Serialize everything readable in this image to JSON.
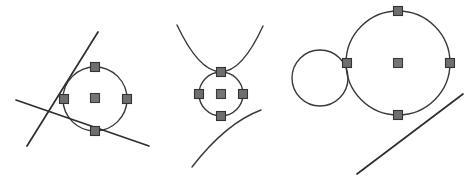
{
  "canvas": {
    "width": 469,
    "height": 184,
    "background": "#ffffff",
    "title": "three tangency configurations of circles, lines and arcs"
  },
  "style": {
    "curve_color": "#3a3a3a",
    "line_color": "#2e2e2e",
    "marker_fill": "#6e6e6e",
    "marker_stroke": "#333333",
    "marker_size": 9,
    "curve_width": 1.4,
    "line_width": 1.7
  },
  "figures": [
    {
      "id": "figure-1",
      "name": "circle-with-two-tangent-lines",
      "circles": [
        {
          "name": "main-circle",
          "cx": 95,
          "cy": 99,
          "r": 32
        }
      ],
      "lines": [
        {
          "name": "steep-tangent-line",
          "x1": 27,
          "y1": 146,
          "x2": 98,
          "y2": 32
        },
        {
          "name": "shallow-tangent-line",
          "x1": 16,
          "y1": 100,
          "x2": 149,
          "y2": 146
        }
      ],
      "arcs": [],
      "markers": [
        {
          "name": "marker-top",
          "cx": 95,
          "cy": 67
        },
        {
          "name": "marker-left",
          "cx": 64,
          "cy": 99
        },
        {
          "name": "marker-right",
          "cx": 127,
          "cy": 99
        },
        {
          "name": "marker-bottom",
          "cx": 95,
          "cy": 131
        },
        {
          "name": "marker-center",
          "cx": 95,
          "cy": 98
        }
      ]
    },
    {
      "id": "figure-2",
      "name": "circle-between-two-tangent-arcs",
      "circles": [
        {
          "name": "main-circle",
          "cx": 221,
          "cy": 94,
          "r": 22
        }
      ],
      "lines": [],
      "arcs": [
        {
          "name": "upper-arc",
          "d": "M 177 25 Q 221 118 263 26"
        },
        {
          "name": "lower-arc",
          "d": "M 192 167 Q 226 123 261 110"
        }
      ],
      "markers": [
        {
          "name": "marker-top",
          "cx": 221,
          "cy": 72
        },
        {
          "name": "marker-left",
          "cx": 199,
          "cy": 94
        },
        {
          "name": "marker-right",
          "cx": 243,
          "cy": 94
        },
        {
          "name": "marker-bottom",
          "cx": 221,
          "cy": 116
        },
        {
          "name": "marker-center",
          "cx": 221,
          "cy": 94
        }
      ]
    },
    {
      "id": "figure-3",
      "name": "large-circle-with-tangent-circle-and-line",
      "circles": [
        {
          "name": "large-circle",
          "cx": 398,
          "cy": 63,
          "r": 52
        },
        {
          "name": "small-tangent-circle",
          "cx": 320,
          "cy": 78,
          "r": 28
        }
      ],
      "lines": [
        {
          "name": "tangent-line",
          "x1": 357,
          "y1": 174,
          "x2": 463,
          "y2": 94
        }
      ],
      "arcs": [],
      "markers": [
        {
          "name": "marker-top",
          "cx": 398,
          "cy": 11
        },
        {
          "name": "marker-left",
          "cx": 347,
          "cy": 63
        },
        {
          "name": "marker-right",
          "cx": 450,
          "cy": 63
        },
        {
          "name": "marker-bottom",
          "cx": 398,
          "cy": 115
        },
        {
          "name": "marker-center",
          "cx": 398,
          "cy": 63
        }
      ]
    }
  ]
}
